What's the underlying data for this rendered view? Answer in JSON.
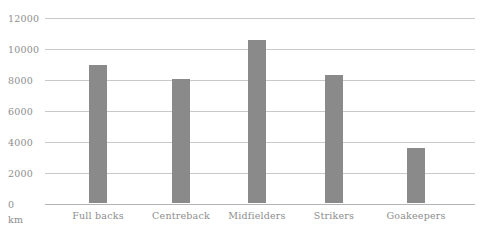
{
  "chart_data": {
    "type": "bar",
    "title": "",
    "xlabel": "",
    "ylabel": "km",
    "unit_label": "km",
    "categories": [
      "Full backs",
      "Centreback",
      "Midfielders",
      "Strikers",
      "Goakeepers"
    ],
    "values": [
      8900,
      8000,
      10500,
      8250,
      3550
    ],
    "series": [
      {
        "name": "Distance covered",
        "values": [
          8900,
          8000,
          10500,
          8250,
          3550
        ]
      }
    ],
    "ylim": [
      0,
      12000
    ],
    "ytick_step": 2000,
    "ytick_labels": [
      "12000",
      "10000",
      "8000",
      "6000",
      "4000",
      "2000",
      "0"
    ],
    "ytick_values": [
      12000,
      10000,
      8000,
      6000,
      4000,
      2000,
      0
    ],
    "grid": true,
    "grid_axis": "y",
    "legend": false,
    "legend_position": "none",
    "colors": {
      "bar": "#8a8a8a",
      "gridline": "#c9c9c9",
      "baseline": "#b4b4b4",
      "text": "#8d8d8d",
      "background": "#ffffff"
    }
  }
}
